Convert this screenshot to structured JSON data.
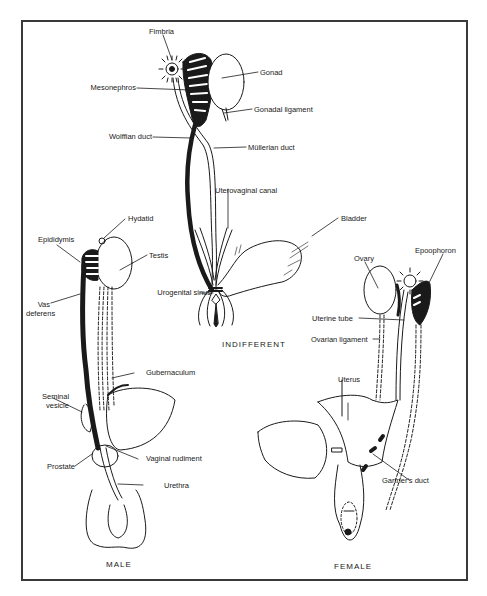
{
  "figure": {
    "panels": {
      "indifferent": {
        "caption": "INDIFFERENT",
        "labels": {
          "fimbria": "Fimbria",
          "gonad": "Gonad",
          "mesonephros": "Mesonephros",
          "gonadal_ligament": "Gonadal ligament",
          "wolffian_duct": "Wolffian duct",
          "mullerian_duct": "Müllerian duct",
          "uterovaginal_canal": "Uterovaginal canal",
          "bladder": "Bladder",
          "urogenital_sinus": "Urogenital sinus"
        }
      },
      "male": {
        "caption": "MALE",
        "labels": {
          "hydatid": "Hydatid",
          "epididymis": "Epididymis",
          "testis": "Testis",
          "vas_deferens_1": "Vas",
          "vas_deferens_2": "deferens",
          "gubernaculum": "Gubernaculum",
          "seminal_vesicle_1": "Seminal",
          "seminal_vesicle_2": "vesicle",
          "vaginal_rudiment": "Vaginal rudiment",
          "prostate": "Prostate",
          "urethra": "Urethra"
        }
      },
      "female": {
        "caption": "FEMALE",
        "labels": {
          "ovary": "Ovary",
          "epoophoron": "Epoophoron",
          "uterine_tube": "Uterine tube",
          "ovarian_ligament": "Ovarian ligament",
          "uterus": "Uterus",
          "gartners_duct": "Gartner's duct"
        }
      }
    },
    "colors": {
      "ink": "#1a1a1a",
      "frame": "#3a3a3a",
      "background": "#ffffff"
    }
  }
}
